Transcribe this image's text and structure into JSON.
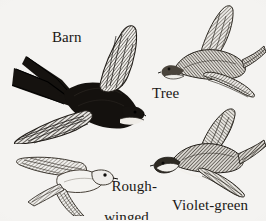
{
  "plate": {
    "title": "Swallows in flight identification plate",
    "background_color": "#f4f3f1",
    "ink_color": "#1a1714",
    "width": 266,
    "height": 220,
    "medium": "pen-and-ink hatched line drawing"
  },
  "labels": {
    "barn": "Barn",
    "tree": "Tree",
    "rough_winged_line1": "Rough-",
    "rough_winged_line2": "winged",
    "violet_green": "Violet-green"
  },
  "birds": [
    {
      "id": "barn-swallow",
      "common_name": "Barn",
      "label": "Barn",
      "tone": "darkest",
      "facing": "right",
      "tail": "deeply forked",
      "position": {
        "x": 4,
        "y": 24,
        "width": 142,
        "height": 120
      },
      "label_position": {
        "x": 52,
        "y": 30
      }
    },
    {
      "id": "tree-swallow",
      "common_name": "Tree",
      "label": "Tree",
      "tone": "medium-light",
      "facing": "left",
      "tail": "notched",
      "position": {
        "x": 158,
        "y": 2,
        "width": 108,
        "height": 96
      },
      "label_position": {
        "x": 152,
        "y": 86
      }
    },
    {
      "id": "rough-winged-swallow",
      "common_name": "Rough-winged",
      "label": "Rough-winged",
      "tone": "lightest",
      "facing": "right",
      "tail": "square",
      "position": {
        "x": 14,
        "y": 136,
        "width": 104,
        "height": 80
      },
      "label_position": {
        "x": 96,
        "y": 163
      }
    },
    {
      "id": "violet-green-swallow",
      "common_name": "Violet-green",
      "label": "Violet-green",
      "tone": "dark",
      "facing": "left",
      "tail": "notched",
      "position": {
        "x": 150,
        "y": 106,
        "width": 116,
        "height": 92
      },
      "label_position": {
        "x": 172,
        "y": 198
      }
    }
  ]
}
